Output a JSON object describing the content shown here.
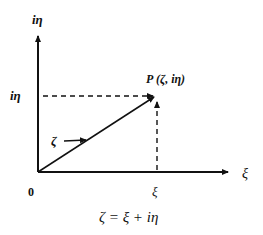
{
  "diagram": {
    "axes": {
      "y_label": "iη",
      "x_label": "ξ",
      "origin_label": "0"
    },
    "point": {
      "label": "P (ζ, iη)"
    },
    "ticks": {
      "y_tick_label": "iη",
      "x_tick_label": "ξ"
    },
    "vector_label": "ζ",
    "equation": "ζ = ξ + iη"
  },
  "colors": {
    "stroke": "#111111",
    "background": "#ffffff"
  }
}
